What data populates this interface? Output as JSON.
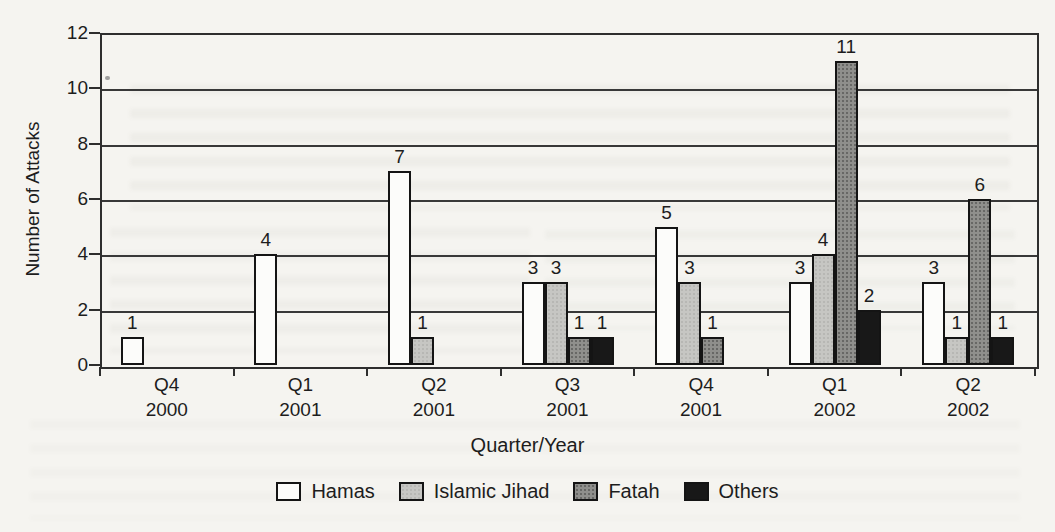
{
  "chart_data": {
    "type": "bar",
    "title": "",
    "ylabel": "Number of Attacks",
    "xlabel": "Quarter/Year",
    "ylim": [
      0,
      12
    ],
    "ytick_step": 2,
    "grid": true,
    "value_labels": true,
    "legend_position": "bottom",
    "categories": [
      {
        "quarter": "Q4",
        "year": "2000"
      },
      {
        "quarter": "Q1",
        "year": "2001"
      },
      {
        "quarter": "Q2",
        "year": "2001"
      },
      {
        "quarter": "Q3",
        "year": "2001"
      },
      {
        "quarter": "Q4",
        "year": "2001"
      },
      {
        "quarter": "Q1",
        "year": "2002"
      },
      {
        "quarter": "Q2",
        "year": "2002"
      }
    ],
    "series": [
      {
        "name": "Hamas",
        "color": "#fcfcfa",
        "values": [
          1,
          4,
          7,
          3,
          5,
          3,
          3
        ]
      },
      {
        "name": "Islamic Jihad",
        "color": "#c6c6c3",
        "values": [
          0,
          0,
          1,
          3,
          3,
          4,
          1
        ]
      },
      {
        "name": "Fatah",
        "color": "#8f8f8c",
        "values": [
          0,
          0,
          0,
          1,
          1,
          11,
          6
        ]
      },
      {
        "name": "Others",
        "color": "#181818",
        "values": [
          0,
          0,
          0,
          1,
          0,
          2,
          1
        ]
      }
    ]
  }
}
